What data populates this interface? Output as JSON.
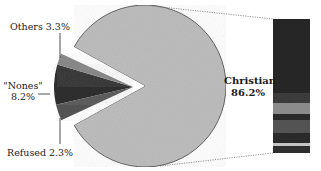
{
  "chart_data": {
    "type": "pie",
    "title": "",
    "slices": [
      {
        "label": "Christian",
        "value": 86.2,
        "display": "86.2%",
        "color": "#bdbdbd",
        "exploded": false
      },
      {
        "label": "\"Nones\"",
        "value": 8.2,
        "display": "8.2%",
        "color": "#2e2e2e",
        "exploded": true
      },
      {
        "label": "Others",
        "value": 3.3,
        "display": "3.3%",
        "color": "#555555",
        "exploded": true
      },
      {
        "label": "Refused",
        "value": 2.3,
        "display": "2.3%",
        "color": "#8a8a8a",
        "exploded": true
      }
    ],
    "breakdown_bar": {
      "of": "Christian",
      "segments_colors_top_to_bottom": [
        "#262626",
        "#3d3d3d",
        "#8e8e8e",
        "#2b2b2b",
        "#555555",
        "#2b2b2b",
        "#c8c8c8",
        "#303030"
      ],
      "segment_labels": []
    },
    "legend": "none",
    "grid": false
  },
  "labels": {
    "others": "Others 3.3%",
    "nones_name": "\"Nones\"",
    "nones_value": "8.2%",
    "refused": "Refused 2.3%",
    "christian_name": "Christian",
    "christian_value": "86.2%"
  }
}
